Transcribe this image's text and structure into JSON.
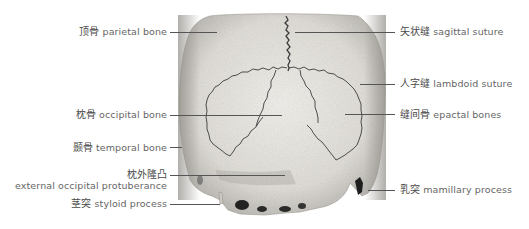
{
  "figure": {
    "colors": {
      "line": "#555555",
      "text": "#555555",
      "bone_light": "#e9e7e2",
      "bone_shade": "#b9b6b0",
      "suture": "#444444"
    }
  },
  "labels": {
    "left": [
      {
        "zh": "顶骨",
        "en": "parietal bone"
      },
      {
        "zh": "枕骨",
        "en": "occipital bone"
      },
      {
        "zh": "颞骨",
        "en": "temporal bone"
      },
      {
        "zh": "枕外隆凸",
        "en": "external occipital protuberance"
      },
      {
        "zh": "茎突",
        "en": "styloid process"
      }
    ],
    "right": [
      {
        "zh": "矢状缝",
        "en": "sagittal suture"
      },
      {
        "zh": "人字缝",
        "en": "lambdoid suture"
      },
      {
        "zh": "缝间骨",
        "en": "epactal bones"
      },
      {
        "zh": "乳突",
        "en": "mamillary process"
      }
    ]
  }
}
